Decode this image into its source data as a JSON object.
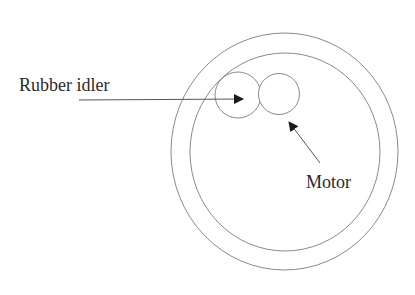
{
  "diagram": {
    "type": "mechanical-schematic",
    "stroke_color": "#8a8a8a",
    "arrow_color": "#1a1a1a",
    "text_color": "#2a2a2a",
    "components": {
      "turntable_outer": {
        "cx": 284.5,
        "cy": 151.5,
        "rx": 113.5,
        "ry": 118.5
      },
      "turntable_inner": {
        "cx": 285,
        "cy": 152,
        "rx": 95,
        "ry": 99
      },
      "rubber_idler": {
        "cx": 238,
        "cy": 95,
        "r": 23
      },
      "motor_pulley": {
        "cx": 279,
        "cy": 94,
        "r": 20.5
      }
    },
    "labels": {
      "idler": "Rubber idler",
      "motor": "Motor"
    },
    "arrows": [
      {
        "target": "rubber_idler",
        "from": [
          79,
          100
        ],
        "to": [
          243,
          99
        ]
      },
      {
        "target": "motor_pulley",
        "from": [
          320,
          163
        ],
        "to": [
          289,
          122
        ]
      }
    ]
  }
}
